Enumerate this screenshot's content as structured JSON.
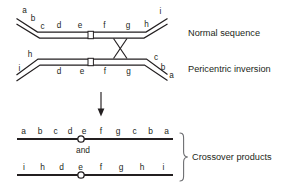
{
  "figure": {
    "colors": {
      "ink": "#231f20",
      "brace": "#6d6e71",
      "background": "#ffffff"
    }
  },
  "normal_chromosome": {
    "label": "Normal sequence",
    "genes_left_arm": [
      "a",
      "b"
    ],
    "genes_body": [
      "c",
      "d",
      "e",
      "f",
      "g",
      "h"
    ],
    "genes_right_arm": [
      "i"
    ],
    "gene_a": "a",
    "gene_b": "b",
    "gene_c": "c",
    "gene_d": "d",
    "gene_e": "e",
    "gene_f": "f",
    "gene_g": "g",
    "gene_h": "h",
    "gene_i": "i",
    "centromere": "centromere"
  },
  "inverted_chromosome": {
    "label": "Pericentric inversion",
    "gene_h": "h",
    "gene_i": "i",
    "gene_d": "d",
    "gene_e": "e",
    "gene_f": "f",
    "gene_g": "g",
    "gene_c": "c",
    "gene_b": "b",
    "gene_a": "a",
    "centromere": "centromere"
  },
  "crossover": {
    "marker": "crossover-x"
  },
  "arrow": {
    "direction": "down"
  },
  "products": {
    "label": "Crossover products",
    "conjunction": "and",
    "product_one": {
      "genes": [
        "a",
        "b",
        "c",
        "d",
        "e",
        "f",
        "g",
        "c",
        "b",
        "a"
      ],
      "centromere_after_index": 4
    },
    "product_two": {
      "genes": [
        "i",
        "h",
        "d",
        "e",
        "f",
        "g",
        "h",
        "i"
      ],
      "centromere_after_index": 3
    }
  }
}
